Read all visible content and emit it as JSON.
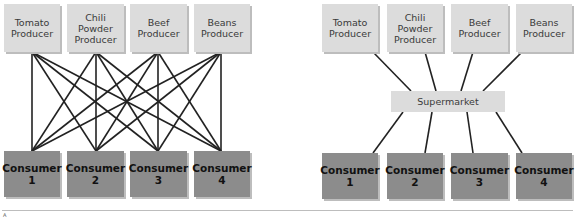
{
  "left_diagram": {
    "producers": [
      {
        "label": "Tomato\nProducer"
      },
      {
        "label": "Chili\nPowder\nProducer"
      },
      {
        "label": "Beef\nProducer"
      },
      {
        "label": "Beans\nProducer"
      }
    ],
    "consumers": [
      {
        "label": "Consumer\n1"
      },
      {
        "label": "Consumer\n2"
      },
      {
        "label": "Consumer\n3"
      },
      {
        "label": "Consumer\n4"
      }
    ]
  },
  "right_diagram": {
    "producers": [
      {
        "label": "Tomato\nProducer"
      },
      {
        "label": "Chili\nPowder\nProducer"
      },
      {
        "label": "Beef\nProducer"
      },
      {
        "label": "Beans\nProducer"
      }
    ],
    "hub": {
      "label": "Supermarket"
    },
    "consumers": [
      {
        "label": "Consumer\n1"
      },
      {
        "label": "Consumer\n2"
      },
      {
        "label": "Consumer\n3"
      },
      {
        "label": "Consumer\n4"
      }
    ]
  },
  "footer": {
    "mark": "A"
  },
  "colors": {
    "producer_fill": "#dcdcdc",
    "consumer_fill": "#8c8c8c",
    "line": "#222222"
  }
}
